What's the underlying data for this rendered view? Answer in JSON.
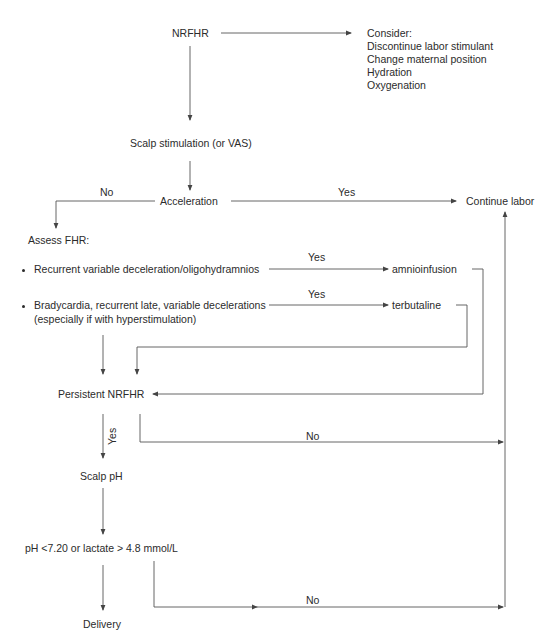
{
  "nodes": {
    "nrfhr": "NRFHR",
    "consider": {
      "title": "Consider:",
      "items": [
        "Discontinue labor stimulant",
        "Change maternal position",
        "Hydration",
        "Oxygenation"
      ]
    },
    "scalp_stimulation": "Scalp stimulation (or VAS)",
    "acceleration": "Acceleration",
    "continue_labor": "Continue labor",
    "assess_fhr": "Assess FHR:",
    "criterion_1": "Recurrent variable deceleration/oligohydramnios",
    "criterion_2_line1": "Bradycardia, recurrent late, variable decelerations",
    "criterion_2_line2": "(especially if with hyperstimulation)",
    "amnioinfusion": "amnioinfusion",
    "terbutaline": "terbutaline",
    "persistent_nrfhr": "Persistent NRFHR",
    "scalp_ph": "Scalp pH",
    "ph_threshold": "pH <7.20 or lactate > 4.8 mmol/L",
    "delivery": "Delivery"
  },
  "edge_labels": {
    "acceleration_no": "No",
    "acceleration_yes": "Yes",
    "criterion_1_yes": "Yes",
    "criterion_2_yes": "Yes",
    "persistent_yes": "Yes",
    "persistent_no": "No",
    "ph_no": "No"
  },
  "colors": {
    "line": "#555555",
    "text": "#2b2b2b",
    "background": "#ffffff"
  }
}
